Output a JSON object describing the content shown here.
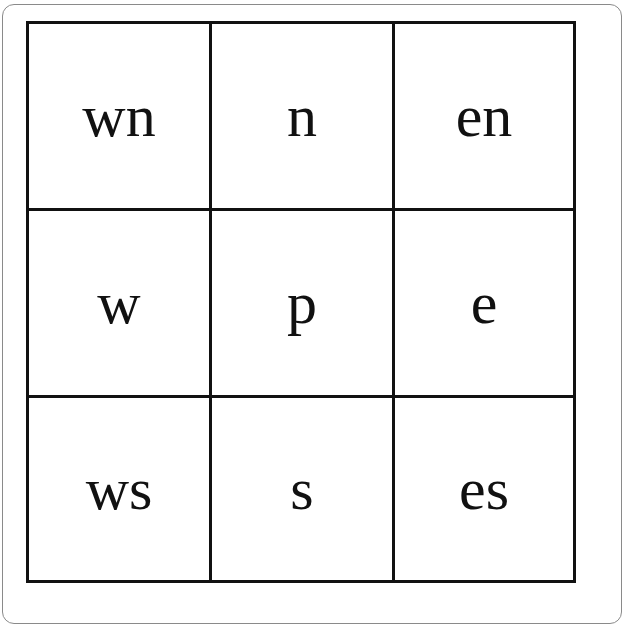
{
  "grid": {
    "rows": [
      [
        {
          "label": "wn"
        },
        {
          "label": "n"
        },
        {
          "label": "en"
        }
      ],
      [
        {
          "label": "w"
        },
        {
          "label": "p"
        },
        {
          "label": "e"
        }
      ],
      [
        {
          "label": "ws"
        },
        {
          "label": "s"
        },
        {
          "label": "es"
        }
      ]
    ]
  },
  "colors": {
    "line": "#111111",
    "frame": "#8a8a8a",
    "background": "#ffffff"
  }
}
